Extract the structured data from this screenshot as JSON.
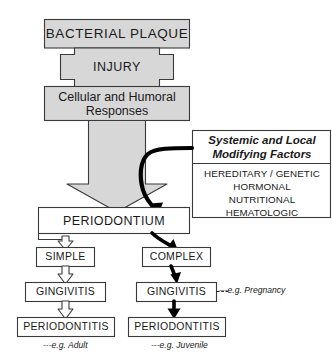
{
  "diagram": {
    "colors": {
      "box_fill_gray": "#d7d7d7",
      "box_outline": "#3a3a3a",
      "arrow_gray_fill": "#d7d7d7",
      "arrow_black": "#000000",
      "text": "#1a1a1a",
      "background": "#ffffff"
    },
    "chain": {
      "bacterial_plaque": "BACTERIAL  PLAQUE",
      "injury": "INJURY",
      "cellular_humoral": "Cellular  and  Humoral\nResponses",
      "periodontium": "PERIODONTIUM"
    },
    "branches": {
      "left": {
        "type": "SIMPLE",
        "gingivitis": "GINGIVITIS",
        "periodontitis": "PERIODONTITIS",
        "example": "---e.g. Adult"
      },
      "right": {
        "type": "COMPLEX",
        "gingivitis": "GINGIVITIS",
        "periodontitis": "PERIODONTITIS",
        "gingivitis_example": "---e.g. Pregnancy",
        "example": "---e.g.  Juvenile"
      }
    },
    "factors": {
      "title": "Systemic and Local\nModifying Factors",
      "items": [
        "HEREDITARY / GENETIC",
        "HORMONAL",
        "NUTRITIONAL",
        "HEMATOLOGIC"
      ],
      "items_text": "HEREDITARY / GENETIC\nHORMONAL\nNUTRITIONAL\nHEMATOLOGIC"
    }
  }
}
